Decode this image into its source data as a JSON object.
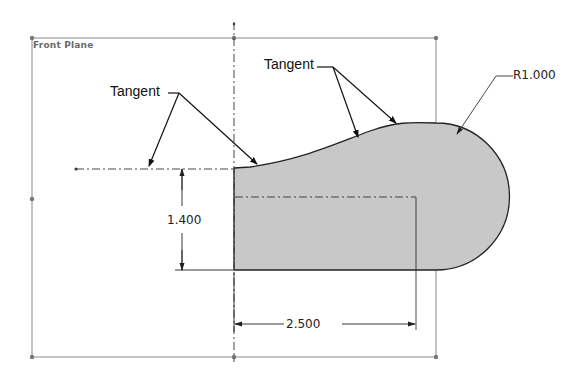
{
  "sketch": {
    "plane_label": "Front Plane",
    "fill_color": "#c8c8c8",
    "outline_color": "#222222",
    "construction_color": "#8a8a8a"
  },
  "callouts": {
    "left_tangent": "Tangent",
    "top_tangent": "Tangent",
    "radius": "R1.000"
  },
  "dimensions": {
    "height": "1.400",
    "width": "2.500"
  }
}
